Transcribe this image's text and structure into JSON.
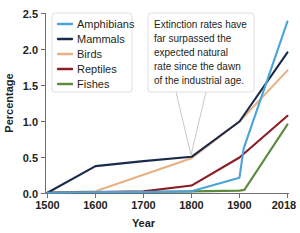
{
  "chart_data": {
    "type": "line",
    "title": "",
    "xlabel": "Year",
    "ylabel": "Percentage",
    "x": [
      "1500",
      "1600",
      "1700",
      "1800",
      "1900",
      "2018"
    ],
    "categories": [
      "1500",
      "1600",
      "1700",
      "1800",
      "1900",
      "2018"
    ],
    "xtick_labels": [
      "1500",
      "1600",
      "1700",
      "1800",
      "1900",
      "2018"
    ],
    "ytick_labels": [
      "0.0",
      "0.5",
      "1.0",
      "1.5",
      "2.0",
      "2.5"
    ],
    "ytick_values": [
      0.0,
      0.5,
      1.0,
      1.5,
      2.0,
      2.5
    ],
    "ylim": [
      0.0,
      2.5
    ],
    "grid": false,
    "legend_position": "top-left",
    "series": [
      {
        "name": "Amphibians",
        "color": "#4BA3D9",
        "values": [
          0.01,
          0.02,
          0.02,
          0.03,
          0.22,
          2.39
        ],
        "x": [
          "1500",
          "1600",
          "1700",
          "1800",
          "1900",
          "2018"
        ],
        "extra_points": [
          {
            "x": "1910",
            "y": 0.62
          }
        ]
      },
      {
        "name": "Mammals",
        "color": "#1B2A4A",
        "values": [
          0.01,
          0.38,
          0.45,
          0.51,
          1.0,
          1.96
        ],
        "x": [
          "1500",
          "1600",
          "1700",
          "1800",
          "1900",
          "2018"
        ]
      },
      {
        "name": "Birds",
        "color": "#E8B183",
        "values": [
          0.01,
          0.03,
          0.26,
          0.49,
          1.0,
          1.71
        ],
        "x": [
          "1500",
          "1600",
          "1700",
          "1800",
          "1900",
          "2018"
        ]
      },
      {
        "name": "Reptiles",
        "color": "#8C1D24",
        "values": [
          0.01,
          0.02,
          0.03,
          0.11,
          0.5,
          1.08
        ],
        "x": [
          "1500",
          "1600",
          "1700",
          "1800",
          "1900",
          "2018"
        ]
      },
      {
        "name": "Fishes",
        "color": "#5D8A3E",
        "values": [
          0.01,
          0.02,
          0.02,
          0.03,
          0.04,
          0.96
        ],
        "x": [
          "1500",
          "1600",
          "1700",
          "1800",
          "1900",
          "2018"
        ],
        "extra_points": [
          {
            "x": "1912",
            "y": 0.05
          }
        ]
      }
    ],
    "annotations": [
      {
        "name": "extinction-callout",
        "lines": [
          "Extinction rates have",
          "far surpassed the",
          "expected natural",
          "rate since the dawn",
          "of the industrial age."
        ],
        "points_to": "1800"
      }
    ]
  },
  "legend": {
    "entries": [
      {
        "label": "Amphibians",
        "color": "#4BA3D9"
      },
      {
        "label": "Mammals",
        "color": "#1B2A4A"
      },
      {
        "label": "Birds",
        "color": "#E8B183"
      },
      {
        "label": "Reptiles",
        "color": "#8C1D24"
      },
      {
        "label": "Fishes",
        "color": "#5D8A3E"
      }
    ]
  },
  "axes": {
    "y_title": "Percentage",
    "x_title": "Year",
    "y_ticks": [
      "2.5",
      "2.0",
      "1.5",
      "1.0",
      "0.5",
      "0.0"
    ],
    "x_ticks": [
      "1500",
      "1600",
      "1700",
      "1800",
      "1900",
      "2018"
    ]
  },
  "callout": {
    "line1": "Extinction rates have",
    "line2": "far surpassed the",
    "line3": "expected natural",
    "line4": "rate since the dawn",
    "line5": "of the industrial age."
  }
}
